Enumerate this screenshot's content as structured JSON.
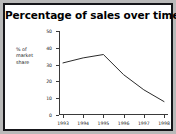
{
  "figure": {
    "title": "Percentage of sales over time",
    "border_color": "#16161a",
    "mat_color": "#b9b9b9",
    "plot_background": "#ffffff",
    "axis_color": "#3a3a3a",
    "line_color": "#2b2b2b"
  },
  "axis": {
    "y_label_line1": "% of",
    "y_label_line2": "market",
    "y_label_line3": "share",
    "y_ticks": [
      "0",
      "10",
      "20",
      "30",
      "40",
      "50"
    ],
    "x_ticks": [
      "1993",
      "1994",
      "1995",
      "1996",
      "1997",
      "1998"
    ]
  },
  "chart_data": {
    "type": "line",
    "title": "Percentage of sales over time",
    "xlabel": "",
    "ylabel": "% of market share",
    "categories": [
      "1993",
      "1994",
      "1995",
      "1996",
      "1997",
      "1998"
    ],
    "x": [
      1993,
      1994,
      1995,
      1996,
      1997,
      1998
    ],
    "values": [
      31,
      34,
      36,
      24,
      15,
      8
    ],
    "series": [
      {
        "name": "% of market share",
        "values": [
          31,
          34,
          36,
          24,
          15,
          8
        ]
      }
    ],
    "ylim": [
      0,
      50
    ],
    "ytick_values": [
      0,
      10,
      20,
      30,
      40,
      50
    ],
    "xlim": [
      1993,
      1998
    ],
    "grid": false,
    "legend": false,
    "legend_position": "none",
    "markers": false,
    "annotations": []
  }
}
